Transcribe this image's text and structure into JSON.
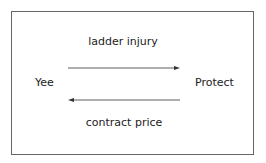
{
  "diagram": {
    "left_party": "Yee",
    "right_party": "Protect",
    "top_flow": {
      "label": "ladder injury",
      "direction": "left-to-right",
      "from": "Yee",
      "to": "Protect"
    },
    "bottom_flow": {
      "label": "contract price",
      "direction": "right-to-left",
      "from": "Protect",
      "to": "Yee"
    }
  }
}
